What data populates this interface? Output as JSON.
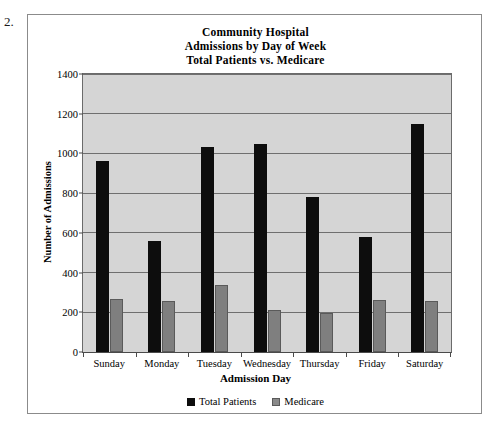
{
  "question_number": "2.",
  "chart_data": {
    "type": "bar",
    "title": "Community Hospital Admissions by Day of Week Total Patients vs. Medicare",
    "title_lines": [
      "Community Hospital",
      "Admissions by Day of Week",
      "Total Patients vs. Medicare"
    ],
    "xlabel": "Admission Day",
    "ylabel": "Number of Admissions",
    "categories": [
      "Sunday",
      "Monday",
      "Tuesday",
      "Wednesday",
      "Thursday",
      "Friday",
      "Saturday"
    ],
    "series": [
      {
        "name": "Total Patients",
        "color": "#0d0d0d",
        "values": [
          960,
          560,
          1030,
          1050,
          780,
          580,
          1150
        ]
      },
      {
        "name": "Medicare",
        "color": "#7f7f7f",
        "values": [
          265,
          255,
          340,
          210,
          195,
          260,
          255
        ]
      }
    ],
    "ylim": [
      0,
      1400
    ],
    "yticks": [
      0,
      200,
      400,
      600,
      800,
      1000,
      1200,
      1400
    ],
    "ytick_labels": [
      "0",
      "200",
      "400",
      "600",
      "800",
      "1000",
      "1200",
      "1400"
    ],
    "grid": true,
    "legend_position": "bottom",
    "plot_background": "#d5d5d5"
  }
}
